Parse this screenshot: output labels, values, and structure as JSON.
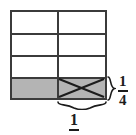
{
  "figure": {
    "type": "fraction-area-model",
    "grid": {
      "columns": 2,
      "rows": 4,
      "cells": [
        {
          "row": 0,
          "col": 0,
          "shaded": false,
          "crossed": false
        },
        {
          "row": 0,
          "col": 1,
          "shaded": false,
          "crossed": false
        },
        {
          "row": 1,
          "col": 0,
          "shaded": false,
          "crossed": false
        },
        {
          "row": 1,
          "col": 1,
          "shaded": false,
          "crossed": false
        },
        {
          "row": 2,
          "col": 0,
          "shaded": false,
          "crossed": false
        },
        {
          "row": 2,
          "col": 1,
          "shaded": false,
          "crossed": false
        },
        {
          "row": 3,
          "col": 0,
          "shaded": true,
          "crossed": false
        },
        {
          "row": 3,
          "col": 1,
          "shaded": true,
          "crossed": true
        }
      ]
    },
    "labels": {
      "right": {
        "brace": "right-curly-brace",
        "numerator": "1",
        "denominator": "4"
      },
      "bottom": {
        "brace": "bottom-curly-brace",
        "numerator": "1",
        "denominator": ""
      }
    },
    "colors": {
      "shade": "#b4b4b4",
      "stroke": "#3b3b3b",
      "ink": "#1c1c1c",
      "background": "#ffffff"
    }
  }
}
